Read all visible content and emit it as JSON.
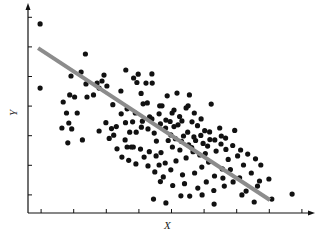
{
  "chart_data": {
    "type": "scatter",
    "title": "",
    "xlabel": "X",
    "ylabel": "Y",
    "xlim": [
      0,
      8.8
    ],
    "ylim": [
      0,
      7
    ],
    "x_ticks": [
      1,
      2,
      3,
      4,
      5,
      6,
      7,
      8,
      9
    ],
    "y_ticks": [
      1,
      2,
      3,
      4,
      5,
      6,
      7
    ],
    "tick_labels_visible": false,
    "grid": false,
    "legend": null,
    "point_color": "#111111",
    "line_color": "#8c8c8c",
    "regression_line": {
      "x1": 0.31,
      "y1": 5.57,
      "x2": 7.42,
      "y2": 0.44
    },
    "series": [
      {
        "name": "observations",
        "points": [
          [
            0.37,
            6.39
          ],
          [
            0.37,
            4.22
          ],
          [
            1.32,
            4.63
          ],
          [
            1.63,
            4.76
          ],
          [
            1.76,
            5.37
          ],
          [
            1.78,
            4.36
          ],
          [
            2.12,
            4.39
          ],
          [
            2.27,
            4.46
          ],
          [
            2.01,
            3.99
          ],
          [
            1.81,
            3.92
          ],
          [
            2.18,
            4.22
          ],
          [
            2.33,
            4.66
          ],
          [
            2.42,
            4.29
          ],
          [
            1.28,
            3.99
          ],
          [
            1.43,
            3.92
          ],
          [
            1.08,
            3.75
          ],
          [
            1.18,
            3.38
          ],
          [
            1.25,
            3.04
          ],
          [
            1.51,
            3.38
          ],
          [
            1.04,
            2.87
          ],
          [
            1.34,
            2.84
          ],
          [
            2.39,
            3.05
          ],
          [
            2.56,
            2.85
          ],
          [
            2.18,
            2.77
          ],
          [
            2.71,
            2.92
          ],
          [
            2.99,
            3.05
          ],
          [
            3.04,
            3.52
          ],
          [
            1.22,
            2.37
          ],
          [
            1.67,
            2.47
          ],
          [
            2.98,
            2.47
          ],
          [
            3.12,
            2.73
          ],
          [
            3.21,
            3.08
          ],
          [
            3.04,
            2.23
          ],
          [
            2.86,
            3.35
          ],
          [
            3.29,
            3.38
          ],
          [
            3.51,
            3.1
          ],
          [
            3.32,
            2.73
          ],
          [
            3.68,
            2.84
          ],
          [
            3.87,
            2.7
          ],
          [
            4.06,
            3.01
          ],
          [
            3.17,
            2.23
          ],
          [
            3.0,
            4.83
          ],
          [
            3.24,
            4.56
          ],
          [
            3.38,
            4.69
          ],
          [
            3.34,
            4.41
          ],
          [
            3.62,
            4.39
          ],
          [
            3.81,
            4.39
          ],
          [
            4.57,
            4.05
          ],
          [
            3.66,
            3.72
          ],
          [
            4.11,
            3.62
          ],
          [
            3.53,
            3.69
          ],
          [
            3.73,
            3.25
          ],
          [
            4.02,
            3.35
          ],
          [
            4.23,
            3.14
          ],
          [
            4.42,
            3.38
          ],
          [
            4.48,
            2.92
          ],
          [
            4.72,
            3.11
          ],
          [
            4.85,
            3.55
          ],
          [
            5.03,
            3.08
          ],
          [
            5.2,
            2.95
          ],
          [
            5.42,
            2.78
          ],
          [
            5.57,
            2.74
          ],
          [
            5.31,
            3.18
          ],
          [
            5.1,
            3.38
          ],
          [
            4.27,
            3.96
          ],
          [
            4.95,
            3.99
          ],
          [
            4.52,
            2.51
          ],
          [
            4.77,
            2.6
          ],
          [
            4.93,
            2.3
          ],
          [
            5.14,
            2.45
          ],
          [
            4.66,
            2.13
          ],
          [
            4.43,
            2.23
          ],
          [
            4.08,
            2.04
          ],
          [
            3.72,
            2.07
          ],
          [
            3.45,
            2.16
          ],
          [
            3.23,
            2.23
          ],
          [
            3.56,
            1.89
          ],
          [
            3.93,
            1.93
          ],
          [
            4.21,
            1.69
          ],
          [
            4.54,
            1.76
          ],
          [
            4.85,
            1.86
          ],
          [
            5.06,
            2.07
          ],
          [
            5.27,
            1.96
          ],
          [
            5.51,
            2.26
          ],
          [
            5.73,
            2.47
          ],
          [
            5.92,
            2.33
          ],
          [
            6.06,
            2.53
          ],
          [
            5.77,
            2.09
          ],
          [
            5.54,
            1.72
          ],
          [
            5.33,
            1.55
          ],
          [
            5.11,
            1.35
          ],
          [
            4.74,
            1.29
          ],
          [
            4.38,
            1.46
          ],
          [
            4.15,
            1.22
          ],
          [
            3.89,
            1.39
          ],
          [
            4.06,
            1.06
          ],
          [
            4.44,
            0.93
          ],
          [
            4.8,
            0.99
          ],
          [
            5.21,
            0.84
          ],
          [
            5.47,
            1.05
          ],
          [
            5.72,
            1.25
          ],
          [
            5.96,
            1.49
          ],
          [
            6.14,
            1.81
          ],
          [
            6.43,
            1.93
          ],
          [
            6.61,
            1.62
          ],
          [
            6.85,
            1.35
          ],
          [
            6.49,
            1.19
          ],
          [
            7.14,
            1.62
          ],
          [
            7.1,
            1.08
          ],
          [
            7.39,
            1.15
          ],
          [
            6.29,
            1.05
          ],
          [
            6.02,
            0.91
          ],
          [
            5.7,
            0.76
          ],
          [
            5.34,
            0.61
          ],
          [
            4.96,
            0.57
          ],
          [
            4.69,
            0.58
          ],
          [
            3.85,
            0.47
          ],
          [
            4.23,
            0.34
          ],
          [
            5.71,
            0.3
          ],
          [
            6.56,
            0.61
          ],
          [
            7.04,
            0.91
          ],
          [
            7.48,
            0.47
          ],
          [
            8.1,
            0.64
          ],
          [
            6.94,
            0.37
          ],
          [
            3.09,
            1.78
          ],
          [
            3.31,
            1.66
          ],
          [
            2.88,
            1.89
          ],
          [
            3.68,
            1.59
          ],
          [
            4.02,
            1.62
          ],
          [
            2.73,
            2.17
          ],
          [
            2.49,
            2.52
          ],
          [
            2.63,
            2.63
          ],
          [
            4.22,
            2.87
          ],
          [
            4.6,
            2.98
          ],
          [
            4.9,
            2.73
          ],
          [
            5.3,
            2.62
          ],
          [
            5.58,
            2.48
          ],
          [
            5.88,
            2.87
          ],
          [
            6.28,
            2.28
          ],
          [
            6.52,
            2.13
          ],
          [
            6.74,
            1.99
          ],
          [
            6.98,
            1.83
          ],
          [
            6.21,
            1.47
          ],
          [
            5.98,
            1.18
          ],
          [
            6.69,
            0.74
          ],
          [
            4.38,
            2.64
          ],
          [
            3.94,
            2.43
          ],
          [
            4.71,
            2.42
          ],
          [
            5.02,
            2.21
          ],
          [
            5.44,
            2.01
          ],
          [
            4.3,
            2.45
          ],
          [
            3.48,
            2.9
          ],
          [
            3.8,
            3.18
          ],
          [
            4.04,
            3.62
          ],
          [
            4.48,
            3.48
          ],
          [
            4.91,
            3.62
          ],
          [
            5.62,
            3.68
          ],
          [
            5.93,
            2.6
          ],
          [
            6.34,
            2.79
          ],
          [
            2.6,
            3.66
          ],
          [
            2.85,
            4.12
          ],
          [
            3.47,
            4.04
          ],
          [
            3.8,
            4.7
          ],
          [
            4.36,
            3.09
          ],
          [
            4.65,
            3.26
          ],
          [
            5.09,
            2.57
          ],
          [
            5.37,
            2.35
          ],
          [
            6.07,
            2.15
          ]
        ]
      }
    ]
  }
}
